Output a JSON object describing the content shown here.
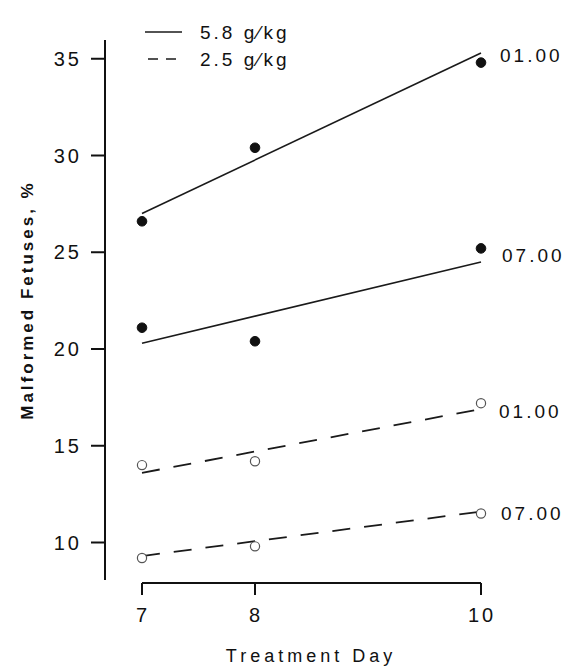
{
  "chart_data": {
    "type": "scatter",
    "title": "",
    "xlabel": "Treatment Day",
    "ylabel": "Malformed Fetuses, %",
    "x_ticks": [
      7,
      8,
      10
    ],
    "y_ticks": [
      10,
      15,
      20,
      25,
      30,
      35
    ],
    "xlim": [
      7,
      10
    ],
    "ylim": [
      8,
      36
    ],
    "grid": false,
    "legend": {
      "position": "top-left",
      "entries": [
        {
          "label": "5.8 g/kg",
          "style": "solid"
        },
        {
          "label": "2.5 g/kg",
          "style": "dashed"
        }
      ]
    },
    "series": [
      {
        "name": "5.8 g/kg, 01.00",
        "dose": "5.8 g/kg",
        "time": "01.00",
        "marker": "filled-circle",
        "line": "solid",
        "x": [
          7,
          8,
          10
        ],
        "values": [
          26.6,
          30.4,
          34.8
        ],
        "fit": {
          "x": [
            7,
            10
          ],
          "y": [
            27.0,
            35.3
          ]
        }
      },
      {
        "name": "5.8 g/kg, 07.00",
        "dose": "5.8 g/kg",
        "time": "07.00",
        "marker": "filled-circle",
        "line": "solid",
        "x": [
          7,
          8,
          10
        ],
        "values": [
          21.1,
          20.4,
          25.2
        ],
        "fit": {
          "x": [
            7,
            10
          ],
          "y": [
            20.3,
            24.5
          ]
        }
      },
      {
        "name": "2.5 g/kg, 01.00",
        "dose": "2.5 g/kg",
        "time": "01.00",
        "marker": "open-circle",
        "line": "dashed",
        "x": [
          7,
          8,
          10
        ],
        "values": [
          14.0,
          14.2,
          17.2
        ],
        "fit": {
          "x": [
            7,
            10
          ],
          "y": [
            13.6,
            16.9
          ]
        }
      },
      {
        "name": "2.5 g/kg, 07.00",
        "dose": "2.5 g/kg",
        "time": "07.00",
        "marker": "open-circle",
        "line": "dashed",
        "x": [
          7,
          8,
          10
        ],
        "values": [
          9.2,
          9.8,
          11.5
        ],
        "fit": {
          "x": [
            7,
            10
          ],
          "y": [
            9.3,
            11.6
          ]
        }
      }
    ]
  },
  "labels": {
    "xlabel": "Treatment Day",
    "ylabel": "Malformed Fetuses, %",
    "legend_solid": "5.8 g∕kg",
    "legend_dashed": "2.5 g∕kg",
    "series_0": "01.00",
    "series_1": "07.00",
    "series_2": "01.00",
    "series_3": "07.00"
  }
}
